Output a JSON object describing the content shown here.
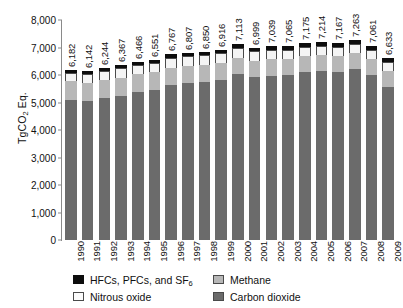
{
  "chart_data": {
    "type": "bar",
    "title": "",
    "subtitle": "",
    "xlabel": "",
    "ylabel": "TgCO2 Eq.",
    "ylabel_rich": "TgCO<sub>2</sub> Eq.",
    "ylim": [
      0,
      8000
    ],
    "ytick_labels": [
      "8,000",
      "7,000",
      "6,000",
      "5,000",
      "4,000",
      "3,000",
      "2,000",
      "1,000",
      "0"
    ],
    "ytick_values": [
      8000,
      7000,
      6000,
      5000,
      4000,
      3000,
      2000,
      1000,
      0
    ],
    "grid": false,
    "stacked": true,
    "legend_position": "bottom",
    "categories": [
      "1990",
      "1991",
      "1992",
      "1993",
      "1994",
      "1995",
      "1996",
      "1997",
      "1998",
      "1999",
      "2000",
      "2001",
      "2002",
      "2003",
      "2004",
      "2005",
      "2006",
      "2007",
      "2008",
      "2009"
    ],
    "totals": [
      6182,
      6142,
      6244,
      6367,
      6466,
      6551,
      6767,
      6807,
      6850,
      6916,
      7113,
      6999,
      7039,
      7065,
      7175,
      7214,
      7167,
      7263,
      7061,
      6633
    ],
    "total_labels": [
      "6,182",
      "6,142",
      "6,244",
      "6,367",
      "6,466",
      "6,551",
      "6,767",
      "6,807",
      "6,850",
      "6,916",
      "7,113",
      "6,999",
      "7,039",
      "7,065",
      "7,175",
      "7,214",
      "7,167",
      "7,263",
      "7,061",
      "6,633"
    ],
    "series": [
      {
        "name": "Carbon dioxide",
        "color": "#6b6b6b",
        "values": [
          5100,
          5050,
          5175,
          5255,
          5380,
          5450,
          5620,
          5710,
          5760,
          5830,
          6020,
          5920,
          5970,
          6000,
          6110,
          6160,
          6120,
          6210,
          6010,
          5570
        ]
      },
      {
        "name": "Methane",
        "color": "#b7b7b7",
        "values": [
          668,
          667,
          652,
          654,
          645,
          648,
          638,
          628,
          619,
          616,
          611,
          606,
          600,
          596,
          590,
          583,
          588,
          592,
          589,
          587
        ]
      },
      {
        "name": "Nitrous oxide",
        "color": "#f4f4f4",
        "values": [
          322,
          330,
          333,
          343,
          341,
          342,
          345,
          341,
          337,
          340,
          342,
          331,
          330,
          328,
          330,
          327,
          322,
          326,
          323,
          320
        ]
      },
      {
        "name": "HFCs, PFCs, and SF6",
        "color": "#0d0d0d",
        "values": [
          92,
          95,
          84,
          115,
          100,
          111,
          164,
          128,
          134,
          130,
          140,
          142,
          139,
          141,
          145,
          144,
          137,
          135,
          139,
          156
        ]
      }
    ]
  },
  "legend": {
    "items": [
      {
        "label": "HFCs, PFCs, and SF6",
        "label_rich": "HFCs, PFCs, and SF<sub>6</sub>",
        "swatch": "hfc"
      },
      {
        "label": "Methane",
        "label_rich": "Methane",
        "swatch": "methane"
      },
      {
        "label": "Nitrous oxide",
        "label_rich": "Nitrous oxide",
        "swatch": "n2o"
      },
      {
        "label": "Carbon dioxide",
        "label_rich": "Carbon dioxide",
        "swatch": "co2"
      }
    ]
  }
}
